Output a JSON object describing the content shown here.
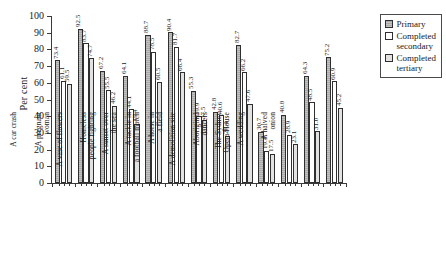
{
  "chart_data": {
    "type": "bar",
    "title": "",
    "xlabel": "",
    "ylabel": "Per cent",
    "ylim": [
      0,
      100
    ],
    "yticks": [
      0,
      10,
      20,
      30,
      40,
      50,
      60,
      70,
      80,
      90,
      100
    ],
    "grid": false,
    "legend_position": "top-right",
    "categories": [
      "A landscape",
      "A car crash",
      "A pregnant\nwoman",
      "A vase of flowers",
      "Homeless\npeople fighting",
      "A sunset over\nthe sea",
      "A tackle in\na football match",
      "A horse in\na field",
      "A demolition site",
      "Aboriginal\ndancers",
      "The Sydney\nOpera House",
      "A wedding",
      "A halved\nonion"
    ],
    "series": [
      {
        "name": "Primary",
        "color": "#a9a9a9",
        "values": [
          73.4,
          92.5,
          67.2,
          64.1,
          88.7,
          90.4,
          55.3,
          42.8,
          82.7,
          30.7,
          40.8,
          64.3,
          75.2
        ]
      },
      {
        "name": "Completed secondary",
        "color": "#ffffff",
        "values": [
          61.1,
          83.7,
          55.5,
          44.1,
          78.5,
          81.7,
          39.9,
          40.6,
          66.2,
          19.4,
          28.9,
          48.5,
          60.9
        ]
      },
      {
        "name": "Completed tertiary",
        "color": "#e2e2e2",
        "values": [
          59.5,
          74.7,
          46.2,
          35.4,
          60.5,
          66.4,
          37.5,
          28.4,
          47.6,
          17.5,
          23.1,
          31.0,
          45.2
        ]
      }
    ]
  },
  "legend": {
    "items": [
      {
        "label": "Primary",
        "swatch": "hatched-gray"
      },
      {
        "label": "Completed\nsecondary",
        "swatch": "white"
      },
      {
        "label": "Completed\ntertiary",
        "swatch": "light-gray"
      }
    ]
  }
}
